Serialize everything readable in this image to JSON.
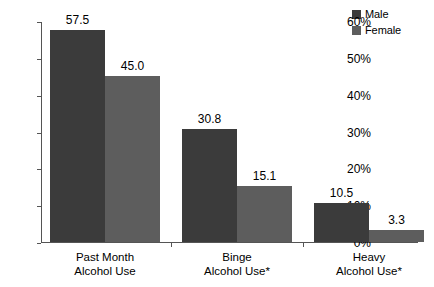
{
  "chart_data": {
    "type": "bar",
    "title": "",
    "subtitle": "",
    "xlabel": "",
    "ylabel": "",
    "ylim": [
      0,
      60
    ],
    "ytick_labels": [
      "0%",
      "10%",
      "20%",
      "30%",
      "40%",
      "50%",
      "60%"
    ],
    "ytick_values": [
      0,
      10,
      20,
      30,
      40,
      50,
      60
    ],
    "grid": false,
    "legend_position": "top-right",
    "categories": [
      "Past Month Alcohol Use",
      "Binge Alcohol Use*",
      "Heavy Alcohol Use*"
    ],
    "category_lines": [
      [
        "Past Month",
        "Alcohol Use"
      ],
      [
        "Binge",
        "Alcohol Use*"
      ],
      [
        "Heavy",
        "Alcohol Use*"
      ]
    ],
    "series": [
      {
        "name": "Male",
        "color": "#3b3b3b",
        "values": [
          57.5,
          30.8,
          10.5
        ],
        "labels": [
          "57.5",
          "30.8",
          "10.5"
        ]
      },
      {
        "name": "Female",
        "color": "#5d5d5d",
        "values": [
          45.0,
          15.1,
          3.3
        ],
        "labels": [
          "45.0",
          "15.1",
          "3.3"
        ]
      }
    ]
  },
  "legend": {
    "items": [
      {
        "label": "Male",
        "color": "#3b3b3b"
      },
      {
        "label": "Female",
        "color": "#5d5d5d"
      }
    ]
  },
  "axes": {
    "y_ticks": [
      {
        "label": "60%",
        "value": 60
      },
      {
        "label": "50%",
        "value": 50
      },
      {
        "label": "40%",
        "value": 40
      },
      {
        "label": "30%",
        "value": 30
      },
      {
        "label": "20%",
        "value": 20
      },
      {
        "label": "10%",
        "value": 10
      },
      {
        "label": "0%",
        "value": 0
      }
    ]
  }
}
